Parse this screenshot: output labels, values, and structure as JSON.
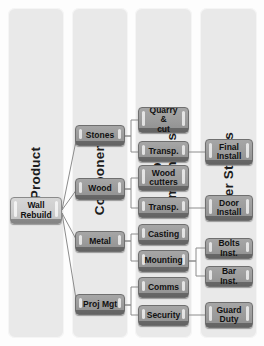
{
  "diagram": {
    "type": "tree-map",
    "accent_box_color": "#9b9b9b",
    "panel_color": "#e9e9e9",
    "connector_color": "#8c8c8c",
    "columns": [
      {
        "id": "product",
        "label": "Product"
      },
      {
        "id": "components",
        "label": "Components"
      },
      {
        "id": "subcomponents",
        "label": "Sub-\nComponents."
      },
      {
        "id": "userstories",
        "label": "User Stories"
      }
    ],
    "nodes": {
      "product": [
        {
          "id": "wall-rebuild",
          "label": "Wall\nRebuild"
        }
      ],
      "components": [
        {
          "id": "stones",
          "label": "Stones"
        },
        {
          "id": "wood",
          "label": "Wood"
        },
        {
          "id": "metal",
          "label": "Metal"
        },
        {
          "id": "proj-mgt",
          "label": "Proj Mgt"
        }
      ],
      "subcomponents": [
        {
          "id": "quarry-cut",
          "label": "Quarry &\ncut"
        },
        {
          "id": "transp-1",
          "label": "Transp."
        },
        {
          "id": "wood-cutters",
          "label": "Wood\ncutters"
        },
        {
          "id": "transp-2",
          "label": "Transp."
        },
        {
          "id": "casting",
          "label": "Casting"
        },
        {
          "id": "mounting",
          "label": "Mounting"
        },
        {
          "id": "comms",
          "label": "Comms"
        },
        {
          "id": "security",
          "label": "Security"
        }
      ],
      "userstories": [
        {
          "id": "final-install",
          "label": "Final\nInstall"
        },
        {
          "id": "door-install",
          "label": "Door\nInstall"
        },
        {
          "id": "bolts-inst",
          "label": "Bolts Inst."
        },
        {
          "id": "bar-inst",
          "label": "Bar Inst."
        },
        {
          "id": "guard-duty",
          "label": "Guard\nDuty"
        }
      ]
    },
    "edges": [
      {
        "from": "wall-rebuild",
        "to": "stones"
      },
      {
        "from": "wall-rebuild",
        "to": "wood"
      },
      {
        "from": "wall-rebuild",
        "to": "metal"
      },
      {
        "from": "wall-rebuild",
        "to": "proj-mgt"
      },
      {
        "from": "stones",
        "to": "quarry-cut"
      },
      {
        "from": "stones",
        "to": "transp-1"
      },
      {
        "from": "wood",
        "to": "wood-cutters"
      },
      {
        "from": "wood",
        "to": "transp-2"
      },
      {
        "from": "metal",
        "to": "casting"
      },
      {
        "from": "metal",
        "to": "mounting"
      },
      {
        "from": "proj-mgt",
        "to": "comms"
      },
      {
        "from": "proj-mgt",
        "to": "security"
      },
      {
        "from": "transp-1",
        "to": "final-install"
      },
      {
        "from": "transp-2",
        "to": "door-install"
      },
      {
        "from": "mounting",
        "to": "bolts-inst"
      },
      {
        "from": "mounting",
        "to": "bar-inst"
      },
      {
        "from": "security",
        "to": "guard-duty"
      }
    ]
  }
}
